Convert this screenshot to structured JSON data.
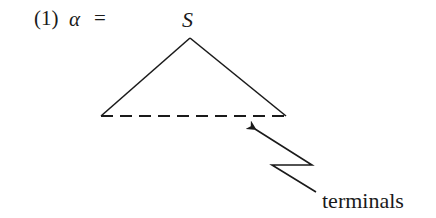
{
  "example": {
    "number": "(1)",
    "lhs": "α",
    "relation": "=",
    "root_label": "S"
  },
  "tree": {
    "shape": "triangle",
    "apex": [
      190,
      38
    ],
    "left_corner": [
      101,
      116
    ],
    "right_corner": [
      286,
      116
    ],
    "base_style": "dashed"
  },
  "annotation": {
    "label": "terminals",
    "arrow_style": "zigzag",
    "points_to": "dashed base of triangle"
  },
  "colors": {
    "ink": "#1a1a1a",
    "background": "#ffffff"
  }
}
